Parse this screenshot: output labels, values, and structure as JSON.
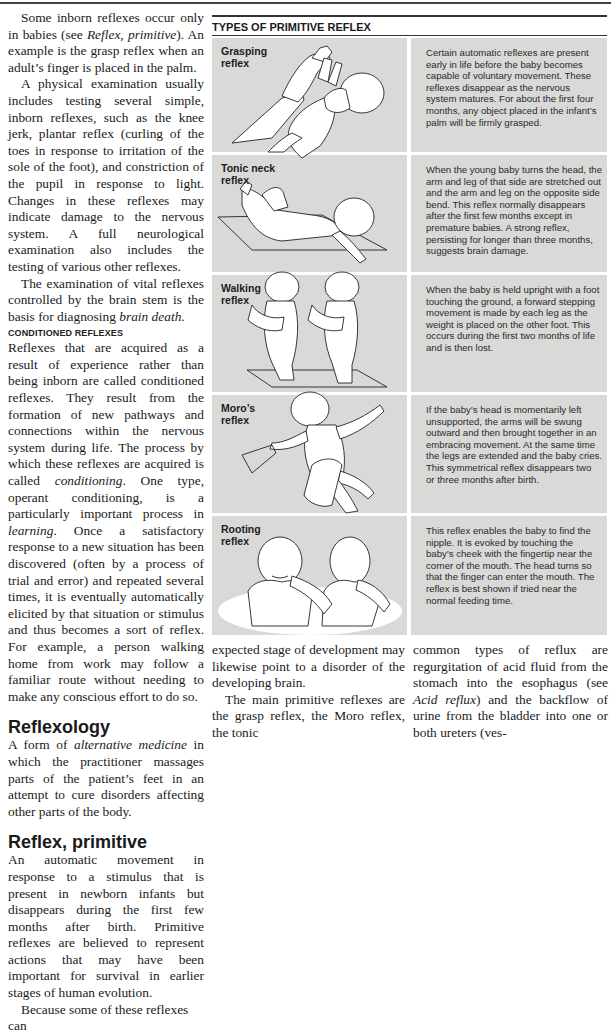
{
  "left_column": {
    "paragraphs": [
      {
        "type": "indent",
        "parts": [
          "Some inborn reflexes occur only in babies (see ",
          {
            "i": "Reflex, primitive"
          },
          "). An example is the grasp reflex when an adult’s finger is placed in the palm."
        ]
      },
      {
        "type": "indent",
        "parts": [
          "A physical examination usually includes testing several simple, inborn reflexes, such as the knee jerk, plantar reflex (curling of the toes in response to irritation of the sole of the foot), and constriction of the pupil in response to light. Changes in these reflexes may indicate damage to the nervous system. A full neurological examination also includes the testing of various other reflexes."
        ]
      },
      {
        "type": "indent",
        "parts": [
          "The examination of vital reflexes controlled by the brain stem is the basis for diagnosing ",
          {
            "i": "brain death"
          },
          "."
        ]
      }
    ],
    "subheading": "CONDITIONED REFLEXES",
    "conditioned_paragraph": [
      "Reflexes that are acquired as a result of experience rather than being inborn are called conditioned reflexes. They result from the formation of new pathways and connections within the nervous system during life. The process by which these reflexes are acquired is called ",
      {
        "i": "conditioning"
      },
      ". One type, operant conditioning, is a particularly important process in ",
      {
        "i": "learning"
      },
      ". Once a satisfactory response to a new situation has been discovered (often by a process of trial and error) and repeated several times, it is eventually automatically elicited by that situation or stimulus and thus becomes a sort of reflex. For example, a person walking home from work may follow a familiar route without needing to make any conscious effort to do so."
    ],
    "entries": [
      {
        "heading": "Reflexology",
        "body": [
          "A form of ",
          {
            "i": "alternative medicine"
          },
          " in which the practitioner massages parts of the patient’s feet in an attempt to cure disorders affecting other parts of the body."
        ]
      },
      {
        "heading": "Reflex, primitive",
        "body": [
          "An automatic movement in response to a stimulus that is present in newborn infants but disappears during the first few months after birth. Primitive reflexes are believed to represent actions that may have been important for survival in earlier stages of human evolution."
        ],
        "continuation": "Because some of these reflexes can"
      }
    ]
  },
  "panel": {
    "title": "TYPES OF PRIMITIVE REFLEX",
    "rows": [
      {
        "label": "Grasping reflex",
        "illustration": "adult-hands-holding-baby-grasping-fingers",
        "description": "Certain automatic reflexes are present early in life before the baby becomes capable of voluntary movement. These reflexes disappear as the nervous system matures. For about the first four months, any object placed in the infant’s palm will be firmly grasped."
      },
      {
        "label": "Tonic neck reflex",
        "illustration": "baby-lying-on-mat-head-turned",
        "description": "When the young baby turns the head, the arm and leg of that side are stretched out and the arm and leg on the opposite side bend. This reflex normally disappears after the first few months except in premature babies. A strong reflex, persisting for longer than three months, suggests brain damage."
      },
      {
        "label": "Walking reflex",
        "illustration": "baby-held-upright-stepping",
        "description": "When the baby is held upright with a foot touching the ground, a forward stepping movement is made by each leg as the weight is placed on the other foot. This occurs during the first two months of life and is then lost."
      },
      {
        "label": "Moro’s reflex",
        "illustration": "baby-arms-flung-outward",
        "description": "If the baby’s head is momentarily left unsupported, the arms will be swung outward and then brought together in an embracing movement. At the same time the legs are extended and the baby cries. This symmetrical reflex disappears two or three months after birth."
      },
      {
        "label": "Rooting reflex",
        "illustration": "finger-touching-baby-cheek",
        "description": "This reflex enables the baby to find the nipple. It is evoked by touching the baby’s cheek with the fingertip near the corner of the mouth. The head turns so that the finger can enter the mouth. The reflex is best shown if tried near the normal feeding time."
      }
    ]
  },
  "bottom_middle": {
    "lines": [
      "expected stage of development may likewise point to a disorder of the developing brain."
    ],
    "paragraph2": "The main primitive reflexes are the grasp reflex, the Moro reflex, the tonic"
  },
  "bottom_right": {
    "parts": [
      "common types of reflux are regurgitation of acid fluid from the stomach into the esophagus (see ",
      {
        "i": "Acid reflux"
      },
      ") and the backflow of urine from the bladder into one or both ureters (ves-"
    ]
  },
  "colors": {
    "panel_box": "#d9d9d8",
    "text": "#1a1a1a",
    "rule": "#333333"
  }
}
